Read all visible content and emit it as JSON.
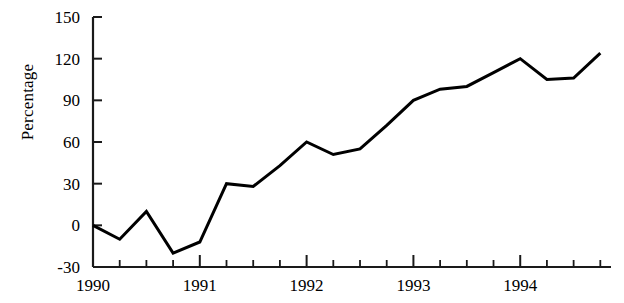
{
  "chart_data": {
    "type": "line",
    "title": "",
    "subtitle": "",
    "xlabel": "",
    "ylabel": "Percentage",
    "ylim": [
      -30,
      150
    ],
    "yticks": [
      -30,
      0,
      30,
      60,
      90,
      120,
      150
    ],
    "ytick_labels": [
      "-30",
      "0",
      "30",
      "60",
      "90",
      "120",
      "150"
    ],
    "xlim": [
      1990.0,
      1994.85
    ],
    "xticks": [
      1990,
      1991,
      1992,
      1993,
      1994
    ],
    "xtick_labels": [
      "1990",
      "1991",
      "1992",
      "1993",
      "1994"
    ],
    "minor_xticks_per_interval": 3,
    "grid": false,
    "legend": false,
    "legend_position": "none",
    "line_color": "#000000",
    "line_width": 3,
    "background_color": "#ffffff",
    "x": [
      1990.0,
      1990.25,
      1990.5,
      1990.75,
      1991.0,
      1991.25,
      1991.5,
      1991.75,
      1992.0,
      1992.25,
      1992.5,
      1992.75,
      1993.0,
      1993.25,
      1993.5,
      1993.75,
      1994.0,
      1994.25,
      1994.5,
      1994.75
    ],
    "values": [
      0,
      -10,
      10,
      -20,
      -12,
      30,
      28,
      43,
      60,
      51,
      55,
      72,
      90,
      98,
      100,
      110,
      120,
      105,
      106,
      124
    ],
    "series": [
      {
        "name": "Percentage",
        "values": [
          0,
          -10,
          10,
          -20,
          -12,
          30,
          28,
          43,
          60,
          51,
          55,
          72,
          90,
          98,
          100,
          110,
          120,
          105,
          106,
          124
        ]
      }
    ],
    "annotations": []
  },
  "axes": {
    "y_axis_title": "Percentage"
  }
}
